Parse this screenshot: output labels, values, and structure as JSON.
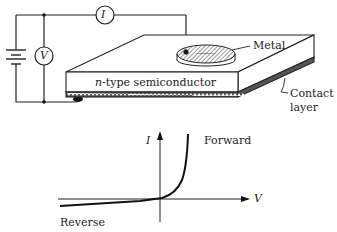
{
  "diagram": {
    "circuit": {
      "ammeter_symbol": "I",
      "voltmeter_symbol": "V"
    },
    "device": {
      "metal_label": "Metal",
      "semiconductor_label_italic": "n",
      "semiconductor_label_rest": "-type semiconductor",
      "contact_label_line1": "Contact",
      "contact_label_line2": "layer"
    },
    "iv_curve": {
      "y_axis_label": "I",
      "x_axis_label": "V",
      "forward_label": "Forward",
      "reverse_label": "Reverse"
    }
  }
}
